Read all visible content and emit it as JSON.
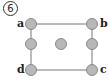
{
  "figure_number": "6",
  "labels": {
    "a": "a",
    "b": "b",
    "c": "c",
    "d": "d"
  },
  "colors": {
    "node_fill": "#b8b8b8",
    "node_stroke": "#8a8a8a",
    "edge": "#777777"
  },
  "nodes": [
    {
      "id": "a",
      "x": 31,
      "y": 24
    },
    {
      "id": "b",
      "x": 92,
      "y": 24
    },
    {
      "id": "left-mid",
      "x": 31,
      "y": 44
    },
    {
      "id": "center",
      "x": 61,
      "y": 44
    },
    {
      "id": "right-mid",
      "x": 92,
      "y": 44
    },
    {
      "id": "d",
      "x": 31,
      "y": 70
    },
    {
      "id": "c",
      "x": 92,
      "y": 70
    }
  ],
  "edges": [
    [
      "a",
      "b"
    ],
    [
      "b",
      "right-mid"
    ],
    [
      "right-mid",
      "c"
    ],
    [
      "c",
      "d"
    ],
    [
      "d",
      "left-mid"
    ],
    [
      "left-mid",
      "a"
    ]
  ]
}
